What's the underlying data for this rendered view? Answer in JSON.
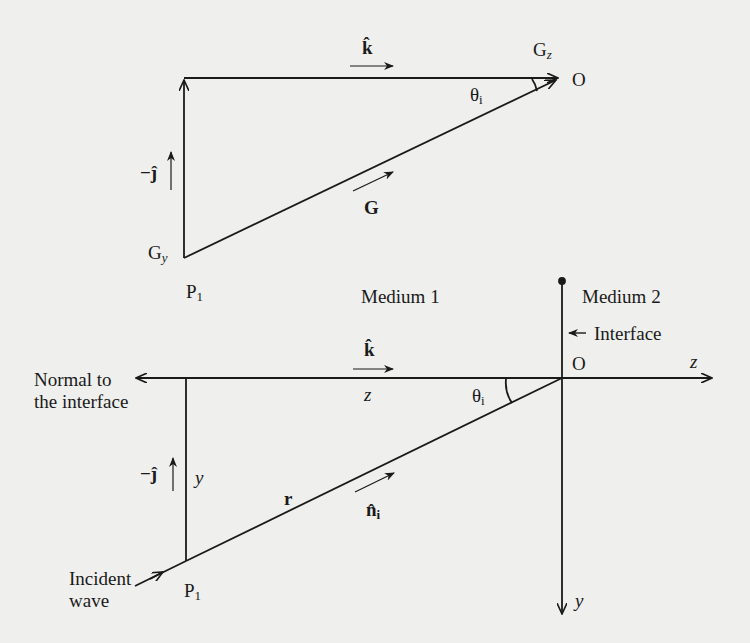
{
  "diagram": {
    "type": "vector geometry of incident wave at interface",
    "top_triangle": {
      "unit_k": "k̂",
      "point_gz": "G",
      "point_gz_sub": "z",
      "origin": "O",
      "angle": "θ",
      "angle_sub": "i",
      "neg_unit_j": "−ĵ",
      "vector_g": "G",
      "point_gy": "G",
      "point_gy_sub": "y",
      "point_p1": "P",
      "point_p1_sub": "1"
    },
    "media": {
      "medium1": "Medium 1",
      "medium2": "Medium 2",
      "interface": "Interface"
    },
    "bottom_triangle": {
      "unit_k": "k̂",
      "z_label": "z",
      "origin": "O",
      "z_axis": "z",
      "normal_line1": "Normal to",
      "normal_line2": "the interface",
      "angle": "θ",
      "angle_sub": "i",
      "neg_unit_j": "−ĵ",
      "y_label": "y",
      "vector_r": "r",
      "unit_n": "n̂",
      "unit_n_sub": "i",
      "incident_line1": "Incident",
      "incident_line2": "wave",
      "point_p1": "P",
      "point_p1_sub": "1",
      "y_axis": "y"
    },
    "colors": {
      "ink": "#1a1a1a",
      "paper": "#efefed"
    }
  }
}
